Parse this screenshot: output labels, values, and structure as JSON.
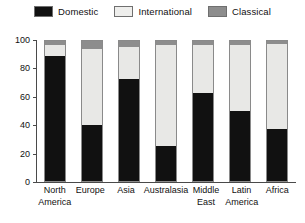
{
  "legend": {
    "position": "top-center",
    "items": [
      {
        "label": "Domestic",
        "color": "#111111",
        "swatch_name": "legend-swatch-domestic"
      },
      {
        "label": "International",
        "color": "#e8e8e6",
        "swatch_name": "legend-swatch-international"
      },
      {
        "label": "Classical",
        "color": "#8d8d8d",
        "swatch_name": "legend-swatch-classical"
      }
    ]
  },
  "axis": {
    "y_ticks": [
      "100",
      "80",
      "60",
      "40",
      "20",
      "0"
    ],
    "y_tick_values": [
      100,
      80,
      60,
      40,
      20,
      0
    ]
  },
  "chart_data": {
    "type": "bar",
    "subtype": "stacked-100-percent",
    "title": "",
    "subtitle": "",
    "xlabel": "",
    "ylabel": "",
    "ylim": [
      0,
      100
    ],
    "grid": false,
    "legend_position": "top-center",
    "categories": [
      "North America",
      "Europe",
      "Asia",
      "Australasia",
      "Middle East",
      "Latin America",
      "Africa"
    ],
    "category_lines": [
      [
        "North",
        "America"
      ],
      [
        "Europe",
        ""
      ],
      [
        "Asia",
        ""
      ],
      [
        "Australasia",
        ""
      ],
      [
        "Middle",
        "East"
      ],
      [
        "Latin",
        "America"
      ],
      [
        "Africa",
        ""
      ]
    ],
    "series": [
      {
        "name": "Domestic",
        "color": "#111111",
        "values": [
          89,
          40,
          73,
          25,
          63,
          50,
          37
        ]
      },
      {
        "name": "International",
        "color": "#e8e8e6",
        "values": [
          8,
          54,
          23,
          72,
          34,
          47,
          61
        ]
      },
      {
        "name": "Classical",
        "color": "#8d8d8d",
        "values": [
          3,
          6,
          4,
          3,
          3,
          3,
          2
        ]
      }
    ],
    "stack_tops": {
      "domestic": [
        89,
        40,
        73,
        25,
        63,
        50,
        37
      ],
      "domestic_plus_international": [
        97,
        94,
        96,
        97,
        97,
        97,
        98
      ],
      "total": [
        100,
        100,
        100,
        100,
        100,
        100,
        100
      ]
    }
  }
}
